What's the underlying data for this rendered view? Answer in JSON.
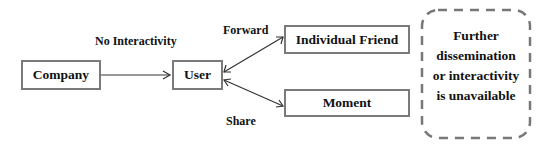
{
  "diagram": {
    "nodes": {
      "company": "Company",
      "user": "User",
      "individual_friend": "Individual Friend",
      "moment": "Moment"
    },
    "edge_labels": {
      "company_to_user": "No Interactivity",
      "forward": "Forward",
      "share": "Share"
    },
    "note": {
      "line1": "Further",
      "line2": "dissemination",
      "line3": "or interactivity",
      "line4": "is unavailable"
    },
    "colors": {
      "border": "#7a7a7a",
      "arrow": "#333333",
      "text": "#111111"
    }
  }
}
